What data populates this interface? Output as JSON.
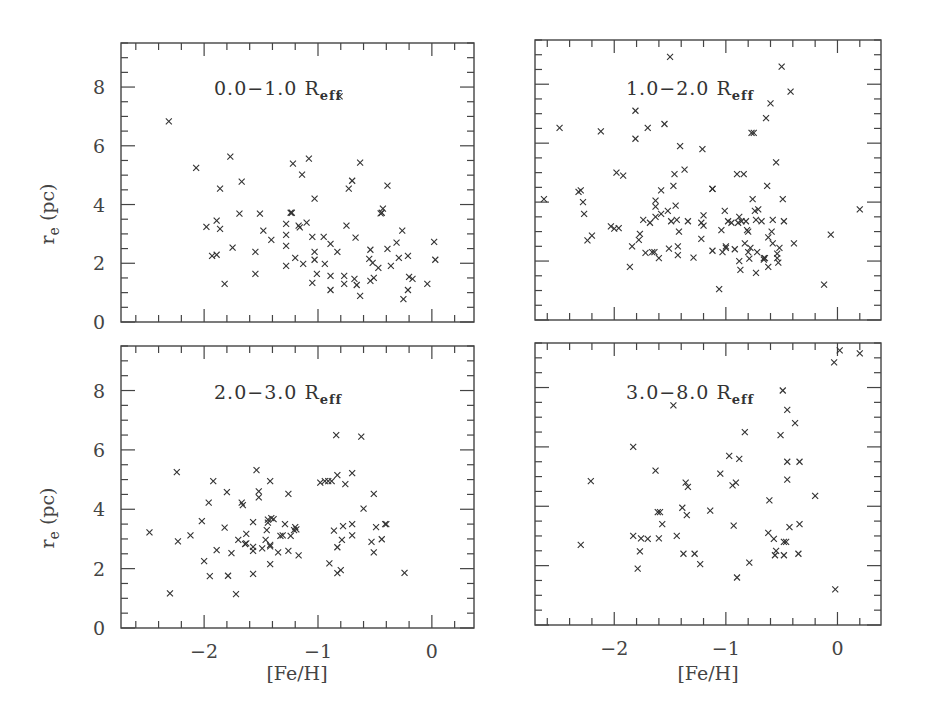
{
  "chart_data": [
    {
      "type": "scatter",
      "panel": "top-left",
      "title": "0.0-1.0 R_eff",
      "xlabel": "[Fe/H]",
      "ylabel": "r_e (pc)",
      "xlim": [
        -2.73,
        0.37
      ],
      "ylim": [
        0,
        9.5
      ],
      "xticks": [
        -2,
        -1,
        0
      ],
      "yticks": [
        0,
        2,
        4,
        6,
        8
      ],
      "show_xticklabels": false,
      "show_yticklabels": true,
      "marker": "x",
      "points": [
        [
          -2.31,
          6.83
        ],
        [
          -2.07,
          5.25
        ],
        [
          -1.77,
          5.63
        ],
        [
          -1.67,
          4.78
        ],
        [
          -1.86,
          4.54
        ],
        [
          -1.98,
          3.24
        ],
        [
          -1.89,
          3.45
        ],
        [
          -1.86,
          3.17
        ],
        [
          -1.93,
          2.25
        ],
        [
          -1.89,
          2.29
        ],
        [
          -1.82,
          1.3
        ],
        [
          -1.75,
          2.53
        ],
        [
          -1.69,
          3.69
        ],
        [
          -1.55,
          2.39
        ],
        [
          -1.55,
          1.64
        ],
        [
          -1.51,
          3.69
        ],
        [
          -1.48,
          3.11
        ],
        [
          -1.41,
          2.8
        ],
        [
          -1.28,
          3.34
        ],
        [
          -1.28,
          2.97
        ],
        [
          -1.28,
          2.59
        ],
        [
          -1.28,
          1.91
        ],
        [
          -1.24,
          3.72
        ],
        [
          -1.22,
          5.39
        ],
        [
          -1.2,
          2.18
        ],
        [
          -1.17,
          3.28
        ],
        [
          -1.14,
          5.02
        ],
        [
          -1.13,
          1.98
        ],
        [
          -1.1,
          3.38
        ],
        [
          -1.08,
          5.56
        ],
        [
          -1.05,
          2.9
        ],
        [
          -1.05,
          1.33
        ],
        [
          -1.03,
          4.2
        ],
        [
          -1.03,
          2.39
        ],
        [
          -1.03,
          2.12
        ],
        [
          -1.01,
          1.64
        ],
        [
          -0.95,
          2.9
        ],
        [
          -0.94,
          1.98
        ],
        [
          -0.89,
          2.66
        ],
        [
          -0.89,
          1.57
        ],
        [
          -0.89,
          1.09
        ],
        [
          -0.83,
          2.39
        ],
        [
          -0.81,
          7.68
        ],
        [
          -0.77,
          1.57
        ],
        [
          -0.77,
          1.3
        ],
        [
          -0.75,
          3.28
        ],
        [
          -0.73,
          4.54
        ],
        [
          -0.7,
          4.81
        ],
        [
          -0.68,
          1.47
        ],
        [
          -0.67,
          2.87
        ],
        [
          -0.66,
          1.26
        ],
        [
          -0.63,
          5.43
        ],
        [
          -0.63,
          0.89
        ],
        [
          -0.54,
          2.46
        ],
        [
          -0.55,
          2.15
        ],
        [
          -0.52,
          2.01
        ],
        [
          -0.54,
          1.4
        ],
        [
          -0.51,
          1.5
        ],
        [
          -0.47,
          1.84
        ],
        [
          -0.44,
          3.72
        ],
        [
          -0.43,
          3.86
        ],
        [
          -0.39,
          4.64
        ],
        [
          -0.39,
          2.49
        ],
        [
          -0.36,
          1.91
        ],
        [
          -0.31,
          2.7
        ],
        [
          -0.29,
          2.18
        ],
        [
          -0.26,
          3.11
        ],
        [
          -0.25,
          0.78
        ],
        [
          -0.21,
          2.25
        ],
        [
          -0.21,
          1.09
        ],
        [
          -0.2,
          1.54
        ],
        [
          -0.17,
          1.47
        ],
        [
          -0.04,
          1.3
        ],
        [
          0.02,
          2.73
        ],
        [
          0.03,
          2.12
        ],
        [
          -1.23,
          3.72
        ],
        [
          -1.16,
          3.22
        ],
        [
          -0.45,
          3.7
        ]
      ]
    },
    {
      "type": "scatter",
      "panel": "top-right",
      "title": "1.0-2.0 R_eff",
      "xlabel": "[Fe/H]",
      "ylabel": "",
      "xlim": [
        -2.71,
        0.39
      ],
      "ylim": [
        0,
        9.5
      ],
      "xticks": [
        -2,
        -1,
        0
      ],
      "yticks": [
        0,
        2,
        4,
        6,
        8
      ],
      "show_xticklabels": false,
      "show_yticklabels": false,
      "marker": "x",
      "points": [
        [
          -2.63,
          4.1
        ],
        [
          -2.49,
          6.52
        ],
        [
          -2.32,
          4.35
        ],
        [
          -2.3,
          4.4
        ],
        [
          -2.28,
          4.0
        ],
        [
          -2.27,
          3.6
        ],
        [
          -2.24,
          2.7
        ],
        [
          -2.2,
          2.86
        ],
        [
          -2.12,
          6.4
        ],
        [
          -2.03,
          3.18
        ],
        [
          -2.0,
          3.1
        ],
        [
          -1.98,
          5.0
        ],
        [
          -1.96,
          3.12
        ],
        [
          -1.92,
          4.9
        ],
        [
          -1.86,
          1.8
        ],
        [
          -1.84,
          2.5
        ],
        [
          -1.81,
          7.1
        ],
        [
          -1.81,
          6.15
        ],
        [
          -1.78,
          2.72
        ],
        [
          -1.77,
          2.92
        ],
        [
          -1.74,
          3.4
        ],
        [
          -1.7,
          6.52
        ],
        [
          -1.72,
          2.28
        ],
        [
          -1.68,
          3.3
        ],
        [
          -1.66,
          2.3
        ],
        [
          -1.64,
          2.3
        ],
        [
          -1.63,
          3.5
        ],
        [
          -1.63,
          4.05
        ],
        [
          -1.63,
          3.85
        ],
        [
          -1.6,
          2.1
        ],
        [
          -1.58,
          3.6
        ],
        [
          -1.58,
          4.4
        ],
        [
          -1.55,
          6.65
        ],
        [
          -1.52,
          3.7
        ],
        [
          -1.51,
          2.42
        ],
        [
          -1.5,
          8.93
        ],
        [
          -1.49,
          3.35
        ],
        [
          -1.47,
          4.55
        ],
        [
          -1.46,
          4.95
        ],
        [
          -1.45,
          3.88
        ],
        [
          -1.44,
          3.4
        ],
        [
          -1.43,
          2.5
        ],
        [
          -1.43,
          2.2
        ],
        [
          -1.42,
          3.0
        ],
        [
          -1.41,
          5.9
        ],
        [
          -1.37,
          5.1
        ],
        [
          -1.34,
          3.35
        ],
        [
          -1.29,
          2.12
        ],
        [
          -1.22,
          3.3
        ],
        [
          -1.2,
          3.55
        ],
        [
          -1.22,
          2.75
        ],
        [
          -1.21,
          5.8
        ],
        [
          -1.2,
          3.2
        ],
        [
          -1.12,
          4.45
        ],
        [
          -1.12,
          4.45
        ],
        [
          -1.12,
          2.35
        ],
        [
          -1.06,
          1.05
        ],
        [
          -1.04,
          3.05
        ],
        [
          -1.03,
          2.3
        ],
        [
          -1.01,
          3.7
        ],
        [
          -1.0,
          2.5
        ],
        [
          -1.0,
          2.45
        ],
        [
          -0.98,
          3.35
        ],
        [
          -0.95,
          3.3
        ],
        [
          -0.92,
          2.4
        ],
        [
          -0.9,
          4.95
        ],
        [
          -0.89,
          3.3
        ],
        [
          -0.88,
          2.0
        ],
        [
          -0.88,
          3.5
        ],
        [
          -0.87,
          1.7
        ],
        [
          -0.86,
          3.35
        ],
        [
          -0.84,
          4.95
        ],
        [
          -0.83,
          2.6
        ],
        [
          -0.82,
          3.35
        ],
        [
          -0.81,
          3.05
        ],
        [
          -0.8,
          3.0
        ],
        [
          -0.8,
          2.3
        ],
        [
          -0.79,
          2.08
        ],
        [
          -0.78,
          2.45
        ],
        [
          -0.77,
          6.35
        ],
        [
          -0.75,
          6.35
        ],
        [
          -0.76,
          4.1
        ],
        [
          -0.74,
          3.7
        ],
        [
          -0.73,
          1.6
        ],
        [
          -0.73,
          3.4
        ],
        [
          -0.71,
          3.75
        ],
        [
          -0.72,
          2.3
        ],
        [
          -0.68,
          3.35
        ],
        [
          -0.66,
          2.05
        ],
        [
          -0.66,
          2.1
        ],
        [
          -0.65,
          2.1
        ],
        [
          -0.64,
          6.85
        ],
        [
          -0.63,
          4.55
        ],
        [
          -0.62,
          1.8
        ],
        [
          -0.62,
          2.8
        ],
        [
          -0.6,
          7.35
        ],
        [
          -0.59,
          3.0
        ],
        [
          -0.58,
          2.6
        ],
        [
          -0.58,
          3.4
        ],
        [
          -0.55,
          5.35
        ],
        [
          -0.54,
          2.25
        ],
        [
          -0.54,
          2.1
        ],
        [
          -0.53,
          1.95
        ],
        [
          -0.52,
          2.45
        ],
        [
          -0.5,
          8.6
        ],
        [
          -0.49,
          4.1
        ],
        [
          -0.48,
          3.35
        ],
        [
          -0.42,
          7.75
        ],
        [
          -0.39,
          2.6
        ],
        [
          -0.12,
          1.2
        ],
        [
          -0.06,
          2.9
        ],
        [
          0.2,
          3.75
        ]
      ]
    },
    {
      "type": "scatter",
      "panel": "bottom-left",
      "title": "2.0-3.0 R_eff",
      "xlabel": "[Fe/H]",
      "ylabel": "r_e (pc)",
      "xlim": [
        -2.73,
        0.37
      ],
      "ylim": [
        0,
        9.5
      ],
      "xticks": [
        -2,
        -1,
        0
      ],
      "yticks": [
        0,
        2,
        4,
        6,
        8
      ],
      "show_xticklabels": true,
      "show_yticklabels": true,
      "marker": "x",
      "points": [
        [
          -2.48,
          3.22
        ],
        [
          -2.3,
          1.17
        ],
        [
          -2.24,
          5.25
        ],
        [
          -2.23,
          2.92
        ],
        [
          -2.12,
          3.12
        ],
        [
          -2.02,
          3.6
        ],
        [
          -2.0,
          2.25
        ],
        [
          -1.96,
          4.22
        ],
        [
          -1.95,
          1.75
        ],
        [
          -1.92,
          4.95
        ],
        [
          -1.89,
          2.62
        ],
        [
          -1.82,
          3.38
        ],
        [
          -1.8,
          4.58
        ],
        [
          -1.79,
          1.76
        ],
        [
          -1.76,
          2.52
        ],
        [
          -1.72,
          1.14
        ],
        [
          -1.7,
          2.97
        ],
        [
          -1.67,
          4.22
        ],
        [
          -1.66,
          4.14
        ],
        [
          -1.64,
          2.83
        ],
        [
          -1.63,
          2.85
        ],
        [
          -1.63,
          3.17
        ],
        [
          -1.57,
          3.57
        ],
        [
          -1.57,
          2.73
        ],
        [
          -1.57,
          2.6
        ],
        [
          -1.57,
          1.82
        ],
        [
          -1.54,
          5.32
        ],
        [
          -1.52,
          4.6
        ],
        [
          -1.52,
          4.4
        ],
        [
          -1.49,
          2.68
        ],
        [
          -1.46,
          2.97
        ],
        [
          -1.45,
          3.3
        ],
        [
          -1.44,
          3.55
        ],
        [
          -1.44,
          3.65
        ],
        [
          -1.42,
          2.8
        ],
        [
          -1.42,
          2.75
        ],
        [
          -1.42,
          4.95
        ],
        [
          -1.42,
          2.15
        ],
        [
          -1.41,
          3.7
        ],
        [
          -1.39,
          3.67
        ],
        [
          -1.35,
          2.55
        ],
        [
          -1.33,
          3.1
        ],
        [
          -1.31,
          3.12
        ],
        [
          -1.29,
          3.5
        ],
        [
          -1.26,
          4.52
        ],
        [
          -1.26,
          2.6
        ],
        [
          -1.24,
          3.1
        ],
        [
          -1.21,
          3.3
        ],
        [
          -1.2,
          3.4
        ],
        [
          -1.19,
          3.32
        ],
        [
          -1.17,
          2.45
        ],
        [
          -0.98,
          4.9
        ],
        [
          -0.94,
          4.95
        ],
        [
          -0.91,
          4.95
        ],
        [
          -0.9,
          2.18
        ],
        [
          -0.88,
          4.95
        ],
        [
          -0.86,
          3.28
        ],
        [
          -0.84,
          6.5
        ],
        [
          -0.83,
          5.15
        ],
        [
          -0.83,
          2.72
        ],
        [
          -0.83,
          1.85
        ],
        [
          -0.8,
          1.95
        ],
        [
          -0.79,
          2.97
        ],
        [
          -0.78,
          3.43
        ],
        [
          -0.76,
          4.85
        ],
        [
          -0.7,
          5.22
        ],
        [
          -0.7,
          3.5
        ],
        [
          -0.7,
          3.12
        ],
        [
          -0.62,
          6.45
        ],
        [
          -0.6,
          4.02
        ],
        [
          -0.53,
          2.9
        ],
        [
          -0.51,
          4.52
        ],
        [
          -0.51,
          2.55
        ],
        [
          -0.49,
          3.4
        ],
        [
          -0.44,
          2.99
        ],
        [
          -0.41,
          3.5
        ],
        [
          -0.4,
          3.5
        ],
        [
          -0.24,
          1.86
        ]
      ]
    },
    {
      "type": "scatter",
      "panel": "bottom-right",
      "title": "3.0-8.0 R_eff",
      "xlabel": "[Fe/H]",
      "ylabel": "",
      "xlim": [
        -2.71,
        0.39
      ],
      "ylim": [
        0,
        9.5
      ],
      "xticks": [
        -2,
        -1,
        0
      ],
      "yticks": [
        0,
        2,
        4,
        6,
        8
      ],
      "show_xticklabels": true,
      "show_yticklabels": false,
      "marker": "x",
      "points": [
        [
          -2.3,
          2.7
        ],
        [
          -2.21,
          4.85
        ],
        [
          -1.83,
          6.0
        ],
        [
          -1.83,
          3.0
        ],
        [
          -1.76,
          2.92
        ],
        [
          -1.77,
          2.48
        ],
        [
          -1.79,
          1.9
        ],
        [
          -1.7,
          2.9
        ],
        [
          -1.63,
          5.2
        ],
        [
          -1.61,
          3.8
        ],
        [
          -1.59,
          3.8
        ],
        [
          -1.6,
          2.92
        ],
        [
          -1.57,
          3.4
        ],
        [
          -1.47,
          7.4
        ],
        [
          -1.44,
          3.0
        ],
        [
          -1.39,
          3.95
        ],
        [
          -1.36,
          4.8
        ],
        [
          -1.34,
          4.65
        ],
        [
          -1.38,
          2.4
        ],
        [
          -1.35,
          3.7
        ],
        [
          -1.28,
          2.4
        ],
        [
          -1.23,
          2.05
        ],
        [
          -1.14,
          3.85
        ],
        [
          -1.05,
          5.1
        ],
        [
          -0.97,
          5.7
        ],
        [
          -0.94,
          4.7
        ],
        [
          -0.91,
          4.8
        ],
        [
          -0.93,
          3.35
        ],
        [
          -0.88,
          5.6
        ],
        [
          -0.9,
          1.6
        ],
        [
          -0.83,
          6.5
        ],
        [
          -0.79,
          2.1
        ],
        [
          -0.61,
          4.2
        ],
        [
          -0.62,
          3.1
        ],
        [
          -0.57,
          2.9
        ],
        [
          -0.55,
          2.5
        ],
        [
          -0.56,
          2.35
        ],
        [
          -0.51,
          6.4
        ],
        [
          -0.49,
          7.9
        ],
        [
          -0.48,
          2.8
        ],
        [
          -0.48,
          2.35
        ],
        [
          -0.46,
          2.8
        ],
        [
          -0.45,
          7.25
        ],
        [
          -0.45,
          5.5
        ],
        [
          -0.45,
          4.9
        ],
        [
          -0.43,
          3.3
        ],
        [
          -0.38,
          6.8
        ],
        [
          -0.35,
          2.4
        ],
        [
          -0.34,
          5.5
        ],
        [
          -0.34,
          3.4
        ],
        [
          -0.2,
          4.35
        ],
        [
          -0.02,
          1.2
        ],
        [
          -0.03,
          8.85
        ],
        [
          0.02,
          9.25
        ],
        [
          0.2,
          9.15
        ]
      ]
    }
  ],
  "panels": [
    {
      "label_main": "0.0−1.0 R",
      "label_sub": "eff"
    },
    {
      "label_main": "1.0−2.0 R",
      "label_sub": "eff"
    },
    {
      "label_main": "2.0−3.0 R",
      "label_sub": "eff"
    },
    {
      "label_main": "3.0−8.0 R",
      "label_sub": "eff"
    }
  ],
  "axes": {
    "xlabel": "[Fe/H]",
    "ylabel_main": "r",
    "ylabel_sub": "e",
    "ylabel_unit": " (pc)",
    "xtick_labels": [
      "−2",
      "−1",
      "0"
    ],
    "ytick_labels": [
      "0",
      "2",
      "4",
      "6",
      "8"
    ]
  }
}
